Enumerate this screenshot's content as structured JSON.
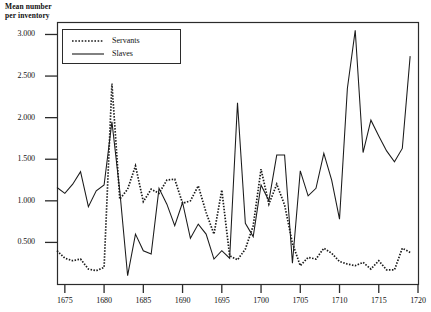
{
  "figure": {
    "y_axis_title": "Mean number\nper inventory",
    "plot_frame": {
      "left": 57,
      "top": 22,
      "right": 418,
      "bottom": 284
    },
    "legend": {
      "box": {
        "left": 62,
        "top": 29,
        "width": 118,
        "height": 34
      },
      "entries": [
        {
          "label": "Servants",
          "style": "dotted"
        },
        {
          "label": "Slaves",
          "style": "solid"
        }
      ]
    },
    "y_ticks": [
      "0.500",
      "1.000",
      "1.500",
      "2.000",
      "2.500",
      "3.000"
    ],
    "x_ticks": [
      "1675",
      "1680",
      "1685",
      "1690",
      "1695",
      "1700",
      "1705",
      "1710",
      "1715",
      "1720"
    ]
  },
  "chart_data": {
    "type": "line",
    "title": "",
    "xlabel": "",
    "ylabel": "Mean number per inventory",
    "xlim": [
      1674,
      1720
    ],
    "ylim": [
      0.0,
      3.15
    ],
    "grid": false,
    "legend_position": "top-left-inside",
    "y_tick_values": [
      0.5,
      1.0,
      1.5,
      2.0,
      2.5,
      3.0
    ],
    "x_tick_values": [
      1675,
      1680,
      1685,
      1690,
      1695,
      1700,
      1705,
      1710,
      1715,
      1720
    ],
    "x": [
      1674,
      1675,
      1676,
      1677,
      1678,
      1679,
      1680,
      1681,
      1682,
      1683,
      1684,
      1685,
      1686,
      1687,
      1688,
      1689,
      1690,
      1691,
      1692,
      1693,
      1694,
      1695,
      1696,
      1697,
      1698,
      1699,
      1700,
      1701,
      1702,
      1703,
      1704,
      1705,
      1706,
      1707,
      1708,
      1709,
      1710,
      1711,
      1712,
      1713,
      1714,
      1715,
      1716,
      1717,
      1718,
      1719
    ],
    "series": [
      {
        "name": "Slaves",
        "style": "solid",
        "color": "#1a1a1a",
        "values": [
          1.16,
          1.09,
          1.2,
          1.35,
          0.93,
          1.12,
          1.19,
          1.95,
          1.12,
          0.1,
          0.6,
          0.4,
          0.36,
          1.15,
          0.96,
          0.7,
          0.98,
          0.55,
          0.72,
          0.6,
          0.3,
          0.4,
          0.31,
          2.18,
          0.73,
          0.57,
          1.19,
          1.0,
          1.55,
          1.55,
          0.25,
          1.36,
          1.06,
          1.15,
          1.57,
          1.25,
          0.78,
          2.35,
          3.05,
          1.58,
          1.97,
          1.78,
          1.6,
          1.47,
          1.63,
          2.74
        ]
      },
      {
        "name": "Servants",
        "style": "dotted",
        "color": "#1a1a1a",
        "values": [
          0.4,
          0.31,
          0.28,
          0.3,
          0.18,
          0.16,
          0.2,
          2.41,
          1.02,
          1.14,
          1.42,
          0.99,
          1.14,
          1.09,
          1.25,
          1.26,
          0.97,
          1.0,
          1.18,
          0.86,
          0.6,
          1.13,
          0.34,
          0.29,
          0.42,
          0.7,
          1.38,
          0.96,
          1.2,
          0.95,
          0.49,
          0.22,
          0.32,
          0.3,
          0.43,
          0.37,
          0.27,
          0.24,
          0.22,
          0.26,
          0.18,
          0.28,
          0.17,
          0.17,
          0.43,
          0.38
        ]
      }
    ]
  }
}
